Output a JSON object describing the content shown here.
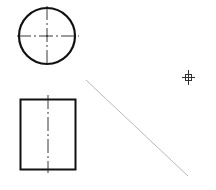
{
  "drawing": {
    "title": "Orthographic projection sketch",
    "views": [
      {
        "id": "top-view",
        "shape": "circle",
        "centerlines": "horizontal-and-vertical"
      },
      {
        "id": "front-view",
        "shape": "rectangle",
        "centerlines": "vertical"
      }
    ],
    "construction_line": {
      "style": "thin",
      "direction": "45-degree"
    },
    "cursor": {
      "type": "crosshair-pickbox"
    },
    "colors": {
      "outline": "#111111",
      "centerline": "#222222",
      "construction": "#b8b8b8",
      "cursor": "#333333",
      "background": "#ffffff"
    }
  }
}
